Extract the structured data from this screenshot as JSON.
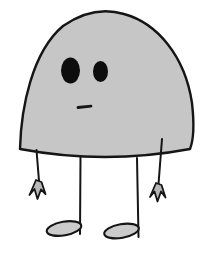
{
  "illustration": {
    "title": "Cartoon dome-shaped creature",
    "description": "A cartoon character with a large gray dome-shaped body outlined in black, two black oval eyes of different sizes, a short flat dash mouth, two thin stick arms ending in small three-pronged claw hands, and two thin stick legs ending in flat tilted oval feet.",
    "colors": {
      "background": "#ffffff",
      "body_fill": "#c6c6c6",
      "outline": "#151515",
      "eye_fill": "#0d0d0d",
      "foot_fill": "#cbcbcb",
      "hand_fill": "#b8b8b8"
    },
    "parts": [
      {
        "name": "creature-body",
        "description": "Asymmetric gray dome with slightly sagging bottom edge"
      },
      {
        "name": "left-eye",
        "description": "Large black vertical oval eye"
      },
      {
        "name": "right-eye",
        "description": "Smaller black vertical oval eye"
      },
      {
        "name": "mouth",
        "description": "Short flat horizontal dash, neutral expression"
      },
      {
        "name": "left-arm",
        "description": "Thin line hanging from bottom-left edge of body"
      },
      {
        "name": "right-arm",
        "description": "Thin line starting inside lower-right of body"
      },
      {
        "name": "left-hand-claw",
        "description": "Small three-pronged claw hand pointing down"
      },
      {
        "name": "right-hand-claw",
        "description": "Small three-pronged claw hand pointing down"
      },
      {
        "name": "left-leg",
        "description": "Thin straight line descending from bottom edge"
      },
      {
        "name": "right-leg",
        "description": "Thin straight line descending from bottom edge"
      },
      {
        "name": "left-foot",
        "description": "Flat gray oval foot attached at right end of leg"
      },
      {
        "name": "right-foot",
        "description": "Flat gray oval foot attached at right end of leg"
      }
    ]
  }
}
